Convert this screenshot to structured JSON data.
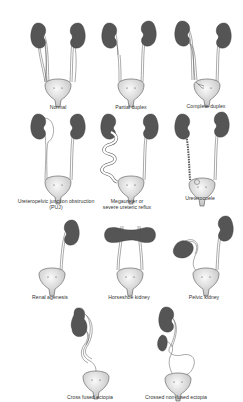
{
  "colors": {
    "kidney": "#555555",
    "bladder_light": "#f2f2f2",
    "bladder_dark": "#c8c8c8",
    "ureter": "#ffffff",
    "outline": "#444444",
    "label": "#333333"
  },
  "figures": [
    {
      "id": "normal",
      "label": "Normal"
    },
    {
      "id": "partial-duplex",
      "label": "Partial duplex"
    },
    {
      "id": "complete-duplex",
      "label": "Complete duplex"
    },
    {
      "id": "puj",
      "label": "Ureteropelvic junction obstruction",
      "label2": "(PUJ)"
    },
    {
      "id": "megaureter",
      "label": "Megaureter or",
      "label2": "severe ureteric reflux"
    },
    {
      "id": "ureterocoele",
      "label": "Ureterocoele"
    },
    {
      "id": "renal-agenesis",
      "label": "Renal agenesis"
    },
    {
      "id": "horseshoe",
      "label": "Horseshoe kidney"
    },
    {
      "id": "pelvic",
      "label": "Pelvic kidney"
    },
    {
      "id": "cross-fused",
      "label": "Cross fused ectopia"
    },
    {
      "id": "crossed-non-fused",
      "label": "Crossed non-fused ectopia"
    }
  ]
}
